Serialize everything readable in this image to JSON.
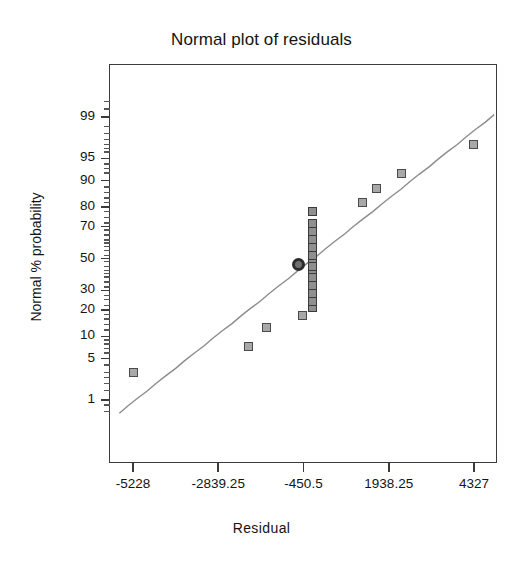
{
  "chart_data": {
    "type": "scatter",
    "title": "Normal plot of residuals",
    "xlabel": "Residual",
    "ylabel": "Normal % probability",
    "grid": false,
    "legend": null,
    "xticks": [
      "-5228",
      "-2839.25",
      "-450.5",
      "1938.25",
      "4327"
    ],
    "xtick_values": [
      -5228,
      -2839.25,
      -450.5,
      1938.25,
      4327
    ],
    "xlim": [
      -6000,
      5100
    ],
    "yticks": [
      "99",
      "95",
      "90",
      "80",
      "70",
      "50",
      "30",
      "20",
      "10",
      "5",
      "1"
    ],
    "ytick_values": [
      99,
      95,
      90,
      80,
      70,
      50,
      30,
      20,
      10,
      5,
      1
    ],
    "yscale": "normal-probability",
    "ylim": [
      0.4,
      99.8
    ],
    "series": [
      {
        "name": "residual points",
        "marker": "square",
        "x": [
          -5228,
          -2000,
          -1500,
          -490,
          -200,
          -200,
          -200,
          -200,
          -200,
          -200,
          -200,
          -200,
          -200,
          -200,
          -200,
          -200,
          -200,
          -200,
          1200,
          1600,
          2300,
          4300
        ],
        "y": [
          3,
          7.5,
          13,
          17.5,
          21,
          24,
          28,
          33,
          38,
          43,
          47,
          52,
          57,
          62,
          67,
          72,
          78,
          45,
          82,
          87.5,
          92,
          97
        ]
      },
      {
        "name": "highlighted point",
        "marker": "circle-outlined",
        "x": [
          -600
        ],
        "y": [
          46
        ]
      }
    ],
    "reference_line": {
      "name": "normal reference line",
      "x": [
        -5620,
        4900
      ],
      "y": [
        0.55,
        99.1
      ]
    }
  }
}
